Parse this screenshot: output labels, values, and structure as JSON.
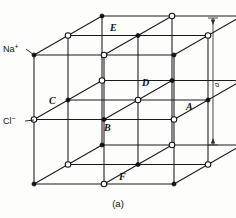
{
  "figure": {
    "caption": "(a)",
    "caption_top": 198,
    "background": "#fdfdfc",
    "line_color": "#1a1a1a"
  },
  "ion_legend": [
    {
      "id": "na",
      "symbol": "Na",
      "charge": "+",
      "label": "Na+",
      "kind": "filled",
      "color": "#141414",
      "label_x": 3,
      "label_y": 52,
      "lead_from": [
        26,
        49
      ],
      "lead_to": [
        34,
        55
      ]
    },
    {
      "id": "cl",
      "symbol": "Cl",
      "charge": "−",
      "label": "Cl-",
      "kind": "open",
      "color": "#ffffff",
      "label_x": 3,
      "label_y": 124,
      "lead_from": [
        25,
        121
      ],
      "lead_to": [
        34,
        120
      ]
    }
  ],
  "dimension": {
    "label": "a",
    "label_x": 219,
    "label_y": 87,
    "axis_x": 213,
    "top_y": 18,
    "bottom_y": 145,
    "tick_half_width": 5
  },
  "site_labels": [
    {
      "name": "E",
      "x": 110,
      "y": 31
    },
    {
      "name": "D",
      "x": 142,
      "y": 86
    },
    {
      "name": "C",
      "x": 49,
      "y": 104
    },
    {
      "name": "A",
      "x": 186,
      "y": 110
    },
    {
      "name": "B",
      "x": 104,
      "y": 131
    },
    {
      "name": "F",
      "x": 119,
      "y": 180
    }
  ],
  "geometry": {
    "origin_x": 34,
    "origin_y": 184,
    "edge_x": 140,
    "edge_y": -129,
    "depth_dx": 68,
    "depth_dy": -39,
    "divisions": 2
  },
  "atoms": {
    "filled_color": "#141414",
    "open_color": "#ffffff",
    "radius_filled": 2.1,
    "radius_open": 2.8,
    "note": "Alternating Na+ (filled) and Cl- (open) on a 3x3x3 grid of lattice points"
  }
}
